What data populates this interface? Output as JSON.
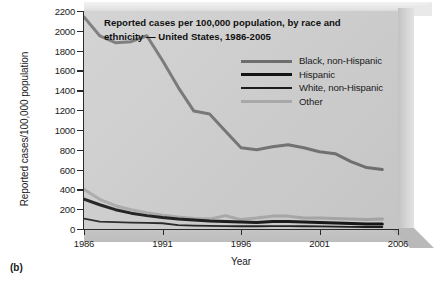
{
  "figure": {
    "panel_label": "(b)",
    "title_line1": "Reported cases per 100,000 population, by race and",
    "title_line2": "ethnicity — United States, 1986-2005"
  },
  "colors": {
    "plot_background": "#cdcdcd",
    "axis": "#2b2b2b",
    "black_non_hispanic": "#6e6e6e",
    "hispanic": "#141414",
    "white_non_hispanic": "#1c1c1c",
    "other": "#a8a8a8",
    "page_background": "#ffffff"
  },
  "chart_data": {
    "type": "line",
    "title": "Reported cases per 100,000 population, by race and ethnicity — United States, 1986-2005",
    "xlabel": "Year",
    "ylabel": "Reported cases/100,000 population",
    "xlim": [
      1986,
      2006
    ],
    "ylim": [
      0,
      2200
    ],
    "ytick_labels": [
      "0",
      "200",
      "400",
      "600",
      "800",
      "1000",
      "1200",
      "1400",
      "1600",
      "1800",
      "2000",
      "2200"
    ],
    "yticks": [
      0,
      200,
      400,
      600,
      800,
      1000,
      1200,
      1400,
      1600,
      1800,
      2000,
      2200
    ],
    "xticks": [
      1986,
      1991,
      1996,
      2001,
      2006
    ],
    "xtick_labels": [
      "1986",
      "1991",
      "1996",
      "2001",
      "2006"
    ],
    "grid": false,
    "legend_position": "upper right",
    "x": [
      1986,
      1987,
      1988,
      1989,
      1990,
      1991,
      1992,
      1993,
      1994,
      1995,
      1996,
      1997,
      1998,
      1999,
      2000,
      2001,
      2002,
      2003,
      2004,
      2005
    ],
    "series": [
      {
        "name": "Black, non-Hispanic",
        "color": "#6e6e6e",
        "width": 3,
        "values": [
          2140,
          1950,
          1880,
          1890,
          1950,
          1700,
          1430,
          1190,
          1160,
          990,
          820,
          800,
          830,
          850,
          820,
          780,
          760,
          680,
          620,
          600
        ]
      },
      {
        "name": "Hispanic",
        "color": "#141414",
        "width": 3,
        "values": [
          300,
          245,
          195,
          160,
          135,
          115,
          100,
          90,
          80,
          75,
          70,
          65,
          75,
          75,
          70,
          65,
          60,
          55,
          50,
          50
        ]
      },
      {
        "name": "White, non-Hispanic",
        "color": "#1c1c1c",
        "width": 1.8,
        "values": [
          105,
          75,
          70,
          65,
          62,
          58,
          40,
          35,
          32,
          30,
          28,
          28,
          30,
          30,
          28,
          26,
          24,
          22,
          20,
          20
        ]
      },
      {
        "name": "Other",
        "color": "#a8a8a8",
        "width": 3,
        "values": [
          400,
          300,
          235,
          195,
          165,
          140,
          120,
          105,
          100,
          135,
          95,
          110,
          130,
          130,
          110,
          110,
          105,
          100,
          95,
          100
        ]
      }
    ]
  }
}
